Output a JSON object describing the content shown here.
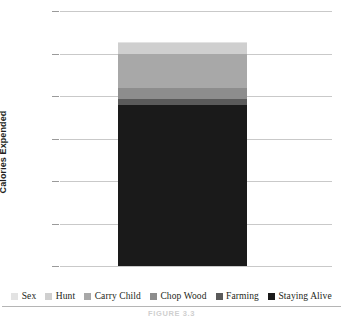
{
  "figure": {
    "caption": "FIGURE 3.3"
  },
  "axes": {
    "ylabel": "Calories Expended",
    "yticks": [
      "3000",
      "2500",
      "2000",
      "1500",
      "1000",
      "500",
      "0"
    ],
    "ymin": 0,
    "ymax": 3000
  },
  "legend": [
    {
      "label": "Sex",
      "color": "#e3e3e3"
    },
    {
      "label": "Hunt",
      "color": "#cfcfcf"
    },
    {
      "label": "Carry Child",
      "color": "#a8a8a8"
    },
    {
      "label": "Chop Wood",
      "color": "#8d8d8d"
    },
    {
      "label": "Farming",
      "color": "#5a5a5a"
    },
    {
      "label": "Staying Alive",
      "color": "#1a1a1a"
    }
  ],
  "chart_data": {
    "type": "bar",
    "title": "",
    "xlabel": "",
    "ylabel": "Calories Expended",
    "ylim": [
      0,
      3000
    ],
    "yticks": [
      0,
      500,
      1000,
      1500,
      2000,
      2500,
      3000
    ],
    "grid": true,
    "stacked": true,
    "legend_position": "bottom",
    "categories": [
      "Daily Energy Budget"
    ],
    "series": [
      {
        "name": "Staying Alive",
        "values": [
          1890
        ],
        "color": "#1a1a1a"
      },
      {
        "name": "Farming",
        "values": [
          75
        ],
        "color": "#5a5a5a"
      },
      {
        "name": "Chop Wood",
        "values": [
          125
        ],
        "color": "#8d8d8d"
      },
      {
        "name": "Carry Child",
        "values": [
          400
        ],
        "color": "#a8a8a8"
      },
      {
        "name": "Hunt",
        "values": [
          130
        ],
        "color": "#cfcfcf"
      },
      {
        "name": "Sex",
        "values": [
          10
        ],
        "color": "#e3e3e3"
      }
    ],
    "total": 2630
  }
}
